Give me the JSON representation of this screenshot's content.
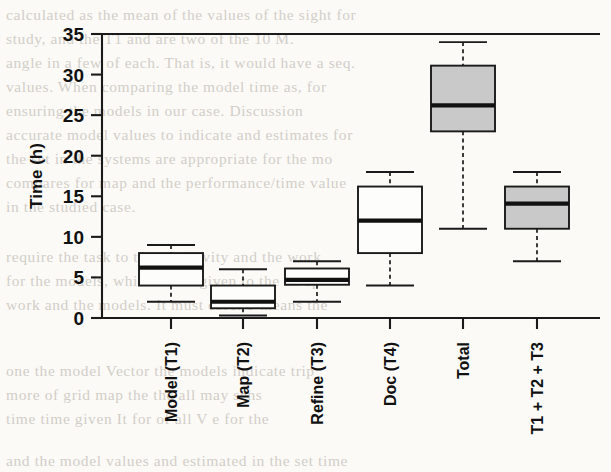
{
  "figure": {
    "background_color": "#fbfaf7",
    "ink_color": "#1a1a1a",
    "fill_gray": "#c9c9c9",
    "fill_white": "#fdfdfb"
  },
  "axes": {
    "ylabel": "Time (h)",
    "y_ticks": [
      "0",
      "5",
      "10",
      "15",
      "20",
      "25",
      "30",
      "35"
    ],
    "y_min": 0,
    "y_max": 35
  },
  "chart_data": {
    "type": "box",
    "title": "",
    "xlabel": "",
    "ylabel": "Time (h)",
    "ylim": [
      0,
      35
    ],
    "ytick_step": 5,
    "grid": false,
    "legend": "none",
    "categories": [
      "Model (T1)",
      "Map (T2)",
      "Refine (T3)",
      "Doc (T4)",
      "Total",
      "T1 + T2 + T3"
    ],
    "boxes": [
      {
        "label": "Model (T1)",
        "whisker_low": 2.0,
        "q1": 4.0,
        "median": 6.2,
        "q3": 8.0,
        "whisker_high": 9.0,
        "fill": "white"
      },
      {
        "label": "Map (T2)",
        "whisker_low": 0.3,
        "q1": 1.2,
        "median": 2.0,
        "q3": 4.0,
        "whisker_high": 6.0,
        "fill": "white"
      },
      {
        "label": "Refine (T3)",
        "whisker_low": 2.0,
        "q1": 4.1,
        "median": 4.7,
        "q3": 6.1,
        "whisker_high": 7.0,
        "fill": "white"
      },
      {
        "label": "Doc (T4)",
        "whisker_low": 4.0,
        "q1": 8.0,
        "median": 12.0,
        "q3": 16.2,
        "whisker_high": 18.0,
        "fill": "white"
      },
      {
        "label": "Total",
        "whisker_low": 11.0,
        "q1": 23.0,
        "median": 26.2,
        "q3": 31.1,
        "whisker_high": 34.0,
        "fill": "gray"
      },
      {
        "label": "T1 + T2 + T3",
        "whisker_low": 7.0,
        "q1": 11.0,
        "median": 14.1,
        "q3": 16.2,
        "whisker_high": 18.0,
        "fill": "gray"
      }
    ]
  },
  "background_text": {
    "lines": [
      {
        "text": "calculated as the mean of the values of the sight for",
        "x": 6,
        "y": 6
      },
      {
        "text": "study, and the T1 and are two of the 10 M.",
        "x": 6,
        "y": 30
      },
      {
        "text": "angle in a few of each. That is, it would have a seq.",
        "x": 6,
        "y": 54
      },
      {
        "text": "values. When comparing the model time as, for",
        "x": 6,
        "y": 78
      },
      {
        "text": "ensuring the models in our case.      Discussion",
        "x": 6,
        "y": 102
      },
      {
        "text": "accurate model values to indicate and estimates for",
        "x": 6,
        "y": 126
      },
      {
        "text": "the set in the systems are appropriate for the mo",
        "x": 6,
        "y": 150
      },
      {
        "text": "compares for map and the performance/time value",
        "x": 6,
        "y": 174
      },
      {
        "text": "in the studied case.",
        "x": 6,
        "y": 198
      },
      {
        "text": "require the task to the sensitivity and the work",
        "x": 6,
        "y": 248
      },
      {
        "text": "for the models, which is the given to the an    ap",
        "x": 6,
        "y": 272
      },
      {
        "text": "work and the models. It must case.  T means the",
        "x": 6,
        "y": 296
      },
      {
        "text": "one      the model    Vector the models indicate trip",
        "x": 6,
        "y": 362
      },
      {
        "text": "more    of  grid   map  the     the all  may    sens",
        "x": 6,
        "y": 386
      },
      {
        "text": "time      time  given  It for  of     all  V  e  for  the",
        "x": 6,
        "y": 410
      },
      {
        "text": "and the model values and estimated in the set time",
        "x": 6,
        "y": 452
      }
    ]
  }
}
